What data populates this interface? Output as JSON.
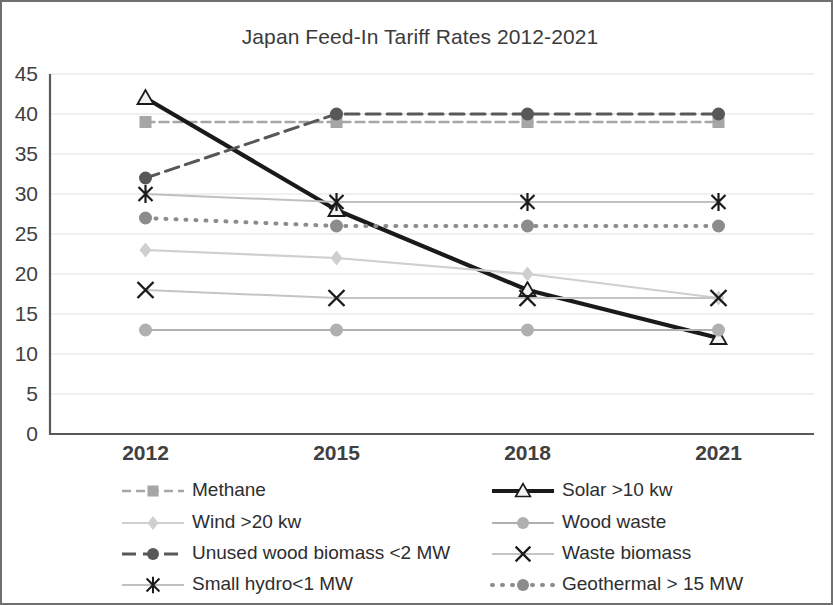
{
  "chart_data": {
    "type": "line",
    "title": "Japan Feed-In Tariff Rates 2012-2021",
    "xlabel": "",
    "ylabel": "",
    "categories": [
      "2012",
      "2015",
      "2018",
      "2021"
    ],
    "ylim": [
      0,
      45
    ],
    "y_ticks": [
      "0",
      "5",
      "10",
      "15",
      "20",
      "25",
      "30",
      "35",
      "40",
      "45"
    ],
    "grid": true,
    "legend_position": "bottom",
    "legend_columns": 2,
    "series": [
      {
        "name": "Methane",
        "values": [
          39,
          39,
          39,
          39
        ],
        "color": "#a6a6a6",
        "marker": "square",
        "dash": "9,5",
        "width": 2.4
      },
      {
        "name": "Solar >10 kw",
        "values": [
          42,
          28,
          18,
          12
        ],
        "color": "#1a1a1a",
        "marker": "triangle",
        "dash": "none",
        "width": 4.2
      },
      {
        "name": "Wind >20 kw",
        "values": [
          23,
          22,
          20,
          17
        ],
        "color": "#cfcfcf",
        "marker": "diamond",
        "dash": "none",
        "width": 2.2
      },
      {
        "name": "Wood waste",
        "values": [
          13,
          13,
          13,
          13
        ],
        "color": "#b0b0b0",
        "marker": "circle",
        "dash": "none",
        "width": 2.2
      },
      {
        "name": "Unused wood biomass <2 MW",
        "values": [
          32,
          40,
          40,
          40
        ],
        "color": "#585858",
        "marker": "circle",
        "dash": "14,7",
        "width": 3.0
      },
      {
        "name": "Waste biomass",
        "values": [
          18,
          17,
          17,
          17
        ],
        "color": "#c4c4c4",
        "marker": "cross",
        "dash": "none",
        "width": 2.0
      },
      {
        "name": "Small hydro<1 MW",
        "values": [
          30,
          29,
          29,
          29
        ],
        "color": "#c0c0c0",
        "marker": "asterisk",
        "dash": "none",
        "width": 2.0
      },
      {
        "name": "Geothermal > 15 MW",
        "values": [
          27,
          26,
          26,
          26
        ],
        "color": "#8c8c8c",
        "marker": "circle",
        "dash": "1,9",
        "width": 4.0
      }
    ]
  },
  "legend": {
    "order": [
      {
        "series": "Methane",
        "column": 0,
        "row": 0
      },
      {
        "series": "Solar >10 kw",
        "column": 1,
        "row": 0
      },
      {
        "series": "Wind >20 kw",
        "column": 0,
        "row": 1
      },
      {
        "series": "Wood waste",
        "column": 1,
        "row": 1
      },
      {
        "series": "Unused wood biomass <2 MW",
        "column": 0,
        "row": 2
      },
      {
        "series": "Waste biomass",
        "column": 1,
        "row": 2
      },
      {
        "series": "Small hydro<1 MW",
        "column": 0,
        "row": 3
      },
      {
        "series": "Geothermal > 15 MW",
        "column": 1,
        "row": 3
      }
    ]
  },
  "layout": {
    "plot_left": 48,
    "plot_right": 812,
    "plot_top": 72,
    "plot_bottom": 432,
    "title_x": 418,
    "title_y": 42,
    "legend_col_x": [
      120,
      490
    ],
    "legend_row_y": [
      489,
      521,
      552,
      583
    ],
    "legend_sample_width": 62,
    "legend_text_gap": 8
  }
}
